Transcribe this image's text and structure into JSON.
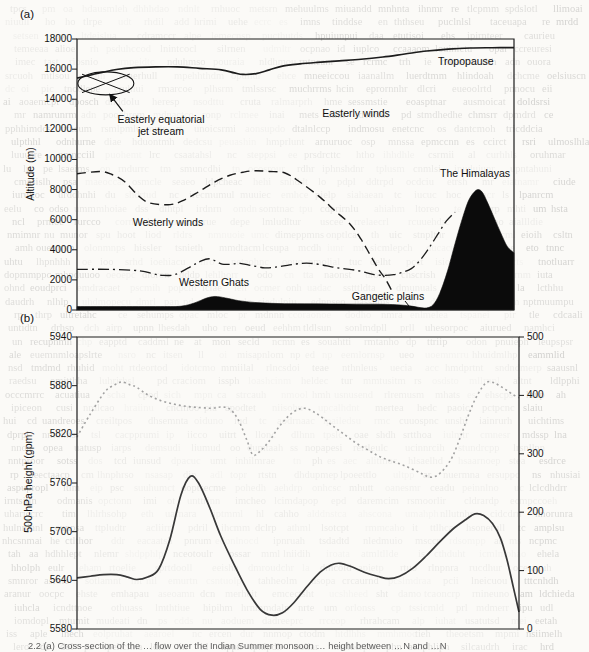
{
  "page": {
    "caption_fragment": "2.2  (a) Cross-section of the … flow over the Indian Summer monsoon … height between …N and …N"
  },
  "panel_a": {
    "label": "(a)",
    "ylabel": "Altitude (m)",
    "yticks": [
      "18000",
      "16000",
      "14000",
      "12000",
      "10000",
      "8000",
      "6000",
      "4000",
      "2000",
      "0"
    ],
    "jet_symbol": {
      "x_pct": 6.6,
      "altitude_m": 15050
    },
    "annotations": {
      "jet_line1": "Easterly equatorial",
      "jet_line2": "jet stream",
      "easterly_winds": "Easterly winds",
      "tropopause": "Tropopause",
      "westerly_winds": "Westerly winds",
      "western_ghats": "Western Ghats",
      "gangetic_plains": "Gangetic plains",
      "himalayas": "The Himalayas"
    }
  },
  "panel_b": {
    "label": "(b)",
    "ylabel": "500-hPa height (gpm)",
    "yticks_left": [
      "5940",
      "5880",
      "5820",
      "5760",
      "5700",
      "5640",
      "5580"
    ],
    "yticks_right": [
      "500",
      "400",
      "300",
      "200",
      "100",
      "0"
    ]
  },
  "chart_data": [
    {
      "type": "area",
      "panel": "a",
      "title": "Schematic cross-section of the summer monsoon flow",
      "xlabel": "west-to-east cross-section (x axis unlabeled)",
      "ylabel": "Altitude (m)",
      "xlim": [
        0,
        100
      ],
      "ylim": [
        0,
        18000
      ],
      "grid": false,
      "series": [
        {
          "name": "Tropopause",
          "style": "solid",
          "points": [
            [
              0,
              15400
            ],
            [
              3,
              15600
            ],
            [
              6,
              15800
            ],
            [
              9,
              15975
            ],
            [
              13,
              16100
            ],
            [
              18,
              16150
            ],
            [
              23,
              16150
            ],
            [
              28,
              16050
            ],
            [
              33,
              15950
            ],
            [
              36,
              15750
            ],
            [
              38,
              15650
            ],
            [
              41,
              15700
            ],
            [
              44,
              15950
            ],
            [
              47,
              16200
            ],
            [
              51,
              16350
            ],
            [
              55,
              16450
            ],
            [
              60,
              16550
            ],
            [
              65,
              16650
            ],
            [
              70,
              16800
            ],
            [
              75,
              17000
            ],
            [
              80,
              17200
            ],
            [
              85,
              17330
            ],
            [
              90,
              17400
            ],
            [
              95,
              17420
            ],
            [
              100,
              17430
            ]
          ]
        },
        {
          "name": "Westerly winds boundary",
          "style": "dashed",
          "points": [
            [
              0,
              9050
            ],
            [
              5.3,
              9200
            ],
            [
              8,
              9000
            ],
            [
              11,
              8500
            ],
            [
              14,
              7600
            ],
            [
              16.7,
              7100
            ],
            [
              21.3,
              7000
            ],
            [
              24.5,
              7300
            ],
            [
              28.1,
              7900
            ],
            [
              31.5,
              8500
            ],
            [
              35,
              8950
            ],
            [
              38,
              9150
            ],
            [
              40.7,
              9250
            ],
            [
              44,
              9200
            ],
            [
              47.6,
              9100
            ],
            [
              51,
              8500
            ],
            [
              55.6,
              7500
            ],
            [
              59,
              6600
            ],
            [
              62.5,
              5700
            ],
            [
              65,
              4700
            ],
            [
              67,
              3700
            ],
            [
              69,
              2700
            ],
            [
              70.5,
              2100
            ],
            [
              72,
              1300
            ]
          ]
        },
        {
          "name": "Low level flow boundary",
          "style": "dashdot",
          "points": [
            [
              0,
              2700
            ],
            [
              7.5,
              2700
            ],
            [
              14.4,
              2600
            ],
            [
              17.5,
              2400
            ],
            [
              19.5,
              2300
            ],
            [
              22.4,
              2350
            ],
            [
              25.5,
              2800
            ],
            [
              28,
              3200
            ],
            [
              30.4,
              3400
            ],
            [
              33.2,
              3050
            ],
            [
              35.5,
              3050
            ],
            [
              37.3,
              3100
            ],
            [
              40,
              2950
            ],
            [
              43,
              2800
            ],
            [
              45.5,
              2850
            ],
            [
              48.7,
              3000
            ],
            [
              51.5,
              3100
            ],
            [
              53.5,
              3100
            ],
            [
              56,
              3000
            ],
            [
              58.5,
              2850
            ],
            [
              61,
              2750
            ],
            [
              63.6,
              2650
            ],
            [
              66,
              2500
            ],
            [
              68,
              2350
            ],
            [
              70.5,
              2300
            ],
            [
              72.5,
              2350
            ],
            [
              74.5,
              2500
            ],
            [
              76.5,
              2750
            ],
            [
              78.5,
              3300
            ],
            [
              80.5,
              4100
            ],
            [
              82.5,
              5000
            ],
            [
              84.5,
              5900
            ],
            [
              86.5,
              6500
            ]
          ]
        },
        {
          "name": "Terrain",
          "style": "filled",
          "points": [
            [
              0,
              230
            ],
            [
              10,
              230
            ],
            [
              20,
              230
            ],
            [
              24,
              260
            ],
            [
              27,
              480
            ],
            [
              29.5,
              780
            ],
            [
              31.6,
              900
            ],
            [
              34,
              800
            ],
            [
              37,
              620
            ],
            [
              40.7,
              500
            ],
            [
              46,
              430
            ],
            [
              52,
              410
            ],
            [
              58,
              400
            ],
            [
              64,
              390
            ],
            [
              70,
              380
            ],
            [
              74,
              330
            ],
            [
              76.5,
              260
            ],
            [
              78.5,
              160
            ],
            [
              80,
              140
            ],
            [
              81.5,
              350
            ],
            [
              83,
              1100
            ],
            [
              84.8,
              2600
            ],
            [
              86.5,
              4400
            ],
            [
              88,
              5900
            ],
            [
              89.5,
              7200
            ],
            [
              90.8,
              7800
            ],
            [
              91.8,
              8000
            ],
            [
              92.8,
              7800
            ],
            [
              94,
              7100
            ],
            [
              95.5,
              6100
            ],
            [
              97,
              5100
            ],
            [
              98.5,
              4200
            ],
            [
              100,
              3800
            ]
          ]
        }
      ]
    },
    {
      "type": "line",
      "panel": "b",
      "title": "",
      "xlabel": "x axis unlabeled",
      "ylabel_left": "500-hPa height (gpm)",
      "ylim_left": [
        5580,
        5940
      ],
      "ylim_right": [
        0,
        500
      ],
      "grid": false,
      "series": [
        {
          "name": "500-hPa height",
          "axis": "left",
          "style": "solid",
          "points": [
            [
              0,
              5643
            ],
            [
              3,
              5645
            ],
            [
              6,
              5647
            ],
            [
              9,
              5647
            ],
            [
              11.5,
              5644
            ],
            [
              13.5,
              5641
            ],
            [
              16,
              5644
            ],
            [
              18.5,
              5654
            ],
            [
              21,
              5690
            ],
            [
              23.5,
              5745
            ],
            [
              25.6,
              5768
            ],
            [
              27.5,
              5760
            ],
            [
              30,
              5730
            ],
            [
              32.5,
              5695
            ],
            [
              35.5,
              5660
            ],
            [
              38.5,
              5628
            ],
            [
              41.5,
              5604
            ],
            [
              44.1,
              5597
            ],
            [
              46.5,
              5600
            ],
            [
              49,
              5612
            ],
            [
              52,
              5632
            ],
            [
              55,
              5650
            ],
            [
              57.5,
              5659
            ],
            [
              59.5,
              5661
            ],
            [
              62,
              5657
            ],
            [
              65,
              5650
            ],
            [
              68,
              5645
            ],
            [
              70.5,
              5642
            ],
            [
              73,
              5645
            ],
            [
              76,
              5655
            ],
            [
              79,
              5670
            ],
            [
              82,
              5687
            ],
            [
              85,
              5703
            ],
            [
              88,
              5715
            ],
            [
              90,
              5722
            ],
            [
              92,
              5720
            ],
            [
              94,
              5710
            ],
            [
              95.8,
              5692
            ],
            [
              97.3,
              5665
            ],
            [
              98.7,
              5632
            ],
            [
              100,
              5601
            ]
          ]
        },
        {
          "name": "Unlabeled dotted series (right axis)",
          "axis": "right",
          "style": "dotted",
          "points": [
            [
              0,
              329
            ],
            [
              3,
              368
            ],
            [
              6.3,
              406
            ],
            [
              8.5,
              418
            ],
            [
              10.2,
              423
            ],
            [
              12,
              418
            ],
            [
              13.5,
              414
            ],
            [
              16,
              401
            ],
            [
              19,
              391
            ],
            [
              22,
              385
            ],
            [
              25,
              381
            ],
            [
              28,
              379
            ],
            [
              30.5,
              378
            ],
            [
              32.5,
              380
            ],
            [
              34.5,
              377
            ],
            [
              36.5,
              358
            ],
            [
              38.5,
              322
            ],
            [
              39.8,
              298
            ],
            [
              41.5,
              305
            ],
            [
              43.5,
              322
            ],
            [
              45.5,
              344
            ],
            [
              47.5,
              362
            ],
            [
              49.5,
              374
            ],
            [
              51.5,
              378
            ],
            [
              53.5,
              372
            ],
            [
              55.5,
              362
            ],
            [
              58,
              347
            ],
            [
              60.5,
              333
            ],
            [
              63,
              319
            ],
            [
              65.5,
              308
            ],
            [
              68,
              297
            ],
            [
              70.5,
              289
            ],
            [
              73,
              283
            ],
            [
              75.5,
              275
            ],
            [
              78,
              266
            ],
            [
              79.9,
              260
            ],
            [
              81.5,
              263
            ],
            [
              83.3,
              276
            ],
            [
              85,
              296
            ],
            [
              86.8,
              330
            ],
            [
              88.5,
              365
            ],
            [
              90,
              392
            ],
            [
              91.5,
              412
            ],
            [
              92.8,
              423
            ],
            [
              94.2,
              422
            ],
            [
              95.5,
              417
            ],
            [
              97,
              410
            ],
            [
              98.5,
              402
            ],
            [
              100,
              396
            ]
          ]
        }
      ]
    }
  ]
}
